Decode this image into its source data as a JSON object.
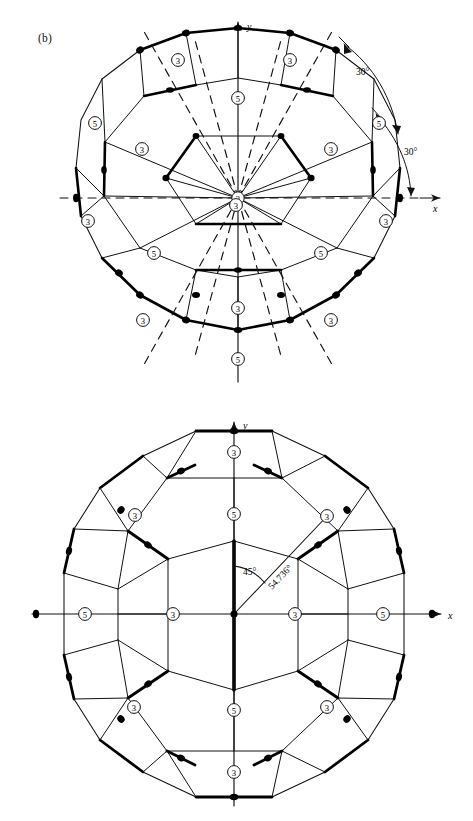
{
  "page": {
    "background": "#ffffff",
    "width": 473,
    "height": 821,
    "line_color": "#111111",
    "bold_line_color": "#000000"
  },
  "panels": [
    {
      "id": "b",
      "label": "(b)",
      "caption": "",
      "axes": {
        "x_label": "x",
        "y_label": "y"
      },
      "center_axis_order": "3",
      "annotations": [
        {
          "name": "arc-30-upper",
          "text": "30°"
        },
        {
          "name": "arc-30-lower",
          "text": "30°"
        }
      ],
      "axis_order_markers": [
        {
          "order": "3",
          "x": 178,
          "y": 60
        },
        {
          "order": "3",
          "x": 290,
          "y": 60
        },
        {
          "order": "5",
          "x": 238,
          "y": 98
        },
        {
          "order": "5",
          "x": 95,
          "y": 123
        },
        {
          "order": "5",
          "x": 379,
          "y": 123
        },
        {
          "order": "3",
          "x": 142,
          "y": 149
        },
        {
          "order": "3",
          "x": 331,
          "y": 149
        },
        {
          "order": "3",
          "x": 236,
          "y": 205
        },
        {
          "order": "3",
          "x": 88,
          "y": 221
        },
        {
          "order": "3",
          "x": 386,
          "y": 221
        },
        {
          "order": "5",
          "x": 154,
          "y": 253
        },
        {
          "order": "5",
          "x": 321,
          "y": 253
        },
        {
          "order": "3",
          "x": 238,
          "y": 308
        },
        {
          "order": "3",
          "x": 143,
          "y": 320
        },
        {
          "order": "3",
          "x": 331,
          "y": 320
        },
        {
          "order": "5",
          "x": 238,
          "y": 359
        }
      ]
    },
    {
      "id": "c",
      "label": "(c)",
      "caption": "",
      "axes": {
        "x_label": "x",
        "y_label": "y"
      },
      "annotations": [
        {
          "name": "angle-45",
          "text": "45°"
        },
        {
          "name": "angle-54736",
          "text": "54.736°"
        }
      ],
      "axis_order_markers": [
        {
          "order": "3",
          "x": 234,
          "y": 452
        },
        {
          "order": "3",
          "x": 135,
          "y": 515
        },
        {
          "order": "5",
          "x": 234,
          "y": 514
        },
        {
          "order": "3",
          "x": 327,
          "y": 516
        },
        {
          "order": "5",
          "x": 85,
          "y": 614
        },
        {
          "order": "3",
          "x": 173,
          "y": 614
        },
        {
          "order": "3",
          "x": 295,
          "y": 614
        },
        {
          "order": "5",
          "x": 383,
          "y": 614
        },
        {
          "order": "3",
          "x": 134,
          "y": 707
        },
        {
          "order": "5",
          "x": 234,
          "y": 710
        },
        {
          "order": "3",
          "x": 327,
          "y": 707
        },
        {
          "order": "3",
          "x": 234,
          "y": 772
        }
      ]
    }
  ],
  "chart_data": {
    "type": "diagram",
    "symbols": {
      "circled_3": "three-fold rotation axis",
      "circled_5": "five-fold rotation axis",
      "bold_edge": "edge in the front / highlighted symmetry chain",
      "dashed_line": "mirror plane trace",
      "dot_marker": "axis emergence point"
    },
    "angles_shown": [
      "30°",
      "30°",
      "45°",
      "54.736°"
    ],
    "axis_labels": [
      "x",
      "y"
    ]
  }
}
